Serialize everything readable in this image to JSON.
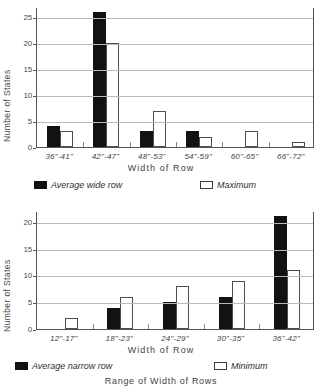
{
  "figure": {
    "caption": "Range of Width of Rows"
  },
  "chart_data": [
    {
      "id": "top",
      "type": "bar",
      "title": "",
      "xlabel": "Width of Row",
      "ylabel": "Number of States",
      "categories": [
        "36\"-41\"",
        "42\"-47\"",
        "48\"-53\"",
        "54\"-59\"",
        "60\"-65\"",
        "66\"-72\""
      ],
      "series": [
        {
          "name": "Average wide row",
          "style": "solid",
          "values": [
            4,
            26,
            3,
            3,
            0,
            0
          ]
        },
        {
          "name": "Maximum",
          "style": "hollow",
          "values": [
            3,
            20,
            7,
            2,
            3,
            1
          ]
        }
      ],
      "ylim": [
        0,
        27
      ],
      "yticks": [
        0,
        5,
        10,
        15,
        20,
        25
      ],
      "grid": true,
      "legend_position": "below"
    },
    {
      "id": "bottom",
      "type": "bar",
      "title": "",
      "xlabel": "Width of Row",
      "ylabel": "Number of States",
      "categories": [
        "12\"-17\"",
        "18\"-23\"",
        "24\"-29\"",
        "30\"-35\"",
        "36\"-42\""
      ],
      "series": [
        {
          "name": "Average narrow row",
          "style": "solid",
          "values": [
            0,
            4,
            5,
            6,
            21
          ]
        },
        {
          "name": "Minimum",
          "style": "hollow",
          "values": [
            2,
            6,
            8,
            9,
            11
          ]
        }
      ],
      "ylim": [
        0,
        22
      ],
      "yticks": [
        0,
        5,
        10,
        15,
        20
      ],
      "grid": true,
      "legend_position": "below"
    }
  ]
}
